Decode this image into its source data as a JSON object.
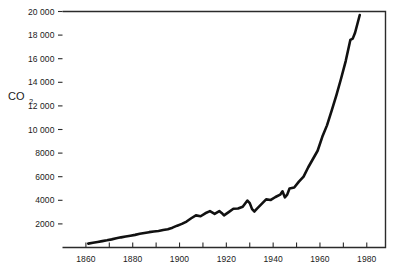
{
  "figure": {
    "background_color": "#ffffff",
    "line_color": "#111111",
    "axis_color": "#2b2b2b"
  },
  "axis_title": {
    "main": "CO",
    "subscript": "2"
  },
  "chart_data": {
    "type": "line",
    "title": "",
    "subtitle": "",
    "xlabel": "",
    "ylabel": "CO2",
    "xlim": [
      1850,
      1988
    ],
    "ylim": [
      0,
      20000
    ],
    "grid": false,
    "legend": null,
    "x_ticks_major": [
      1860,
      1880,
      1900,
      1920,
      1940,
      1960,
      1980
    ],
    "x_tick_labels": [
      "1860",
      "1880",
      "1900",
      "1920",
      "1940",
      "1960",
      "1980"
    ],
    "x_ticks_minor": [
      1870,
      1890,
      1910,
      1930,
      1950,
      1970
    ],
    "y_ticks": [
      2000,
      4000,
      6000,
      8000,
      10000,
      12000,
      14000,
      16000,
      18000,
      20000
    ],
    "y_tick_labels": [
      "2000",
      "4000",
      "6000",
      "8000",
      "10 000",
      "12 000",
      "14 000",
      "16 000",
      "18 000",
      "20 000"
    ],
    "series": [
      {
        "name": "CO2",
        "x": [
          1861,
          1863,
          1865,
          1867,
          1869,
          1871,
          1873,
          1875,
          1877,
          1879,
          1881,
          1883,
          1885,
          1887,
          1889,
          1891,
          1893,
          1895,
          1897,
          1899,
          1901,
          1903,
          1905,
          1907,
          1909,
          1911,
          1913,
          1915,
          1917,
          1918,
          1919,
          1921,
          1923,
          1925,
          1927,
          1929,
          1930,
          1931,
          1932,
          1933,
          1935,
          1937,
          1939,
          1941,
          1943,
          1944,
          1945,
          1946,
          1947,
          1949,
          1951,
          1953,
          1955,
          1957,
          1959,
          1961,
          1963,
          1965,
          1967,
          1969,
          1971,
          1973,
          1974,
          1975,
          1977
        ],
        "values": [
          330,
          400,
          470,
          540,
          610,
          690,
          780,
          860,
          930,
          1000,
          1070,
          1160,
          1230,
          1300,
          1360,
          1400,
          1480,
          1550,
          1680,
          1850,
          2000,
          2200,
          2480,
          2720,
          2650,
          2900,
          3080,
          2850,
          3080,
          2930,
          2720,
          3000,
          3280,
          3300,
          3450,
          3980,
          3760,
          3250,
          3050,
          3280,
          3680,
          4080,
          4030,
          4280,
          4480,
          4760,
          4250,
          4480,
          5000,
          5080,
          5580,
          6000,
          6800,
          7500,
          8200,
          9380,
          10350,
          11600,
          12900,
          14300,
          15800,
          17600,
          17700,
          18200,
          19700
        ]
      }
    ],
    "annotations": []
  }
}
